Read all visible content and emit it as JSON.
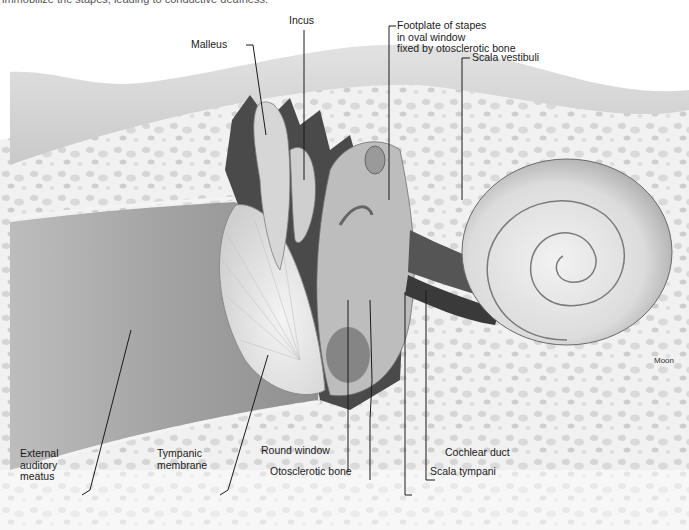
{
  "caption": {
    "partial_text": "immobilize the stapes, leading to conductive deafness."
  },
  "figure": {
    "labels": {
      "malleus": "Malleus",
      "incus": "Incus",
      "footplate_line1": "Footplate of stapes",
      "footplate_line2": "in oval window",
      "footplate_line3": "fixed by otosclerotic bone",
      "scala_vestibuli": "Scala vestibuli",
      "external_line1": "External",
      "external_line2": "auditory",
      "external_line3": "meatus",
      "tympanic_line1": "Tympanic",
      "tympanic_line2": "membrane",
      "round_window": "Round window",
      "otosclerotic_bone": "Otosclerotic bone",
      "cochlear_duct": "Cochlear duct",
      "scala_tympani": "Scala tympani"
    },
    "signature": "Moon"
  },
  "colors": {
    "background": "#ffffff",
    "bone": "#eeeeee",
    "bone_spots": "#c8c8c8",
    "canal": "#a8a8a8",
    "skin": "#d4d4d4",
    "ossicle": "#d8d8d8",
    "dark_tissue": "#4a4a4a",
    "leader": "#1a1a1a"
  }
}
